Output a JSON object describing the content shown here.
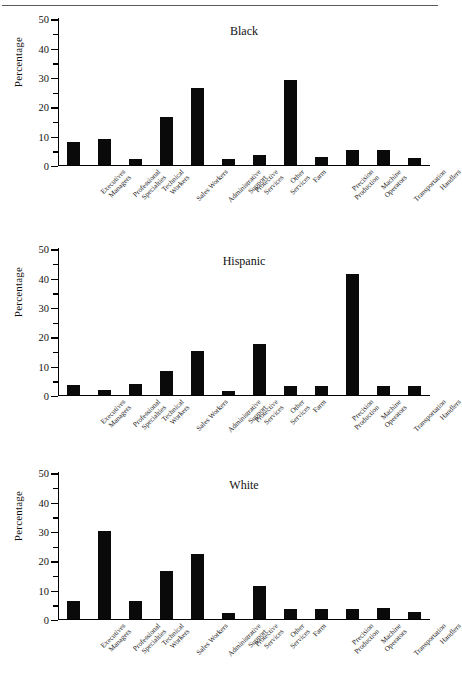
{
  "figure": {
    "y_axis_label": "Percentage",
    "y_ticks": [
      "0",
      "10",
      "20",
      "30",
      "40",
      "50"
    ],
    "categories": [
      "Executives\nManagers",
      "Professional\nSpecialties",
      "Technical\nWorkers",
      "Sales Workers",
      "Administrative\nSupport",
      "Protective\nServices",
      "Other\nServices",
      "Farm",
      "Precision\nProduction",
      "Machine\nOperators",
      "Transportation",
      "Handlers"
    ]
  },
  "chart_data": [
    {
      "type": "bar",
      "title": "Black",
      "xlabel": "",
      "ylabel": "Percentage",
      "ylim": [
        0,
        50
      ],
      "yticks": [
        0,
        10,
        20,
        30,
        40,
        50
      ],
      "minor_tick_step": 5,
      "grid": false,
      "legend": "none",
      "bar_color": "#0a0a0a",
      "categories": [
        "Executives Managers",
        "Professional Specialties",
        "Technical Workers",
        "Sales Workers",
        "Administrative Support",
        "Protective Services",
        "Other Services",
        "Farm",
        "Precision Production",
        "Machine Operators",
        "Transportation",
        "Handlers"
      ],
      "values": [
        7.6,
        8.8,
        1.8,
        16.1,
        26.0,
        1.8,
        3.2,
        28.9,
        2.5,
        5.0,
        5.0,
        2.4
      ]
    },
    {
      "type": "bar",
      "title": "Hispanic",
      "xlabel": "",
      "ylabel": "Percentage",
      "ylim": [
        0,
        50
      ],
      "yticks": [
        0,
        10,
        20,
        30,
        40,
        50
      ],
      "minor_tick_step": 5,
      "grid": false,
      "legend": "none",
      "bar_color": "#0a0a0a",
      "categories": [
        "Executives Managers",
        "Professional Specialties",
        "Technical Workers",
        "Sales Workers",
        "Administrative Support",
        "Protective Services",
        "Other Services",
        "Farm",
        "Precision Production",
        "Machine Operators",
        "Transportation",
        "Handlers"
      ],
      "values": [
        3.2,
        1.7,
        3.7,
        8.2,
        15.0,
        1.4,
        17.4,
        2.8,
        2.9,
        41.3,
        3.1,
        3.0
      ]
    },
    {
      "type": "bar",
      "title": "White",
      "xlabel": "",
      "ylabel": "Percentage",
      "ylim": [
        0,
        50
      ],
      "yticks": [
        0,
        10,
        20,
        30,
        40,
        50
      ],
      "minor_tick_step": 5,
      "grid": false,
      "legend": "none",
      "bar_color": "#0a0a0a",
      "categories": [
        "Executives Managers",
        "Professional Specialties",
        "Technical Workers",
        "Sales Workers",
        "Administrative Support",
        "Protective Services",
        "Other Services",
        "Farm",
        "Precision Production",
        "Machine Operators",
        "Transportation",
        "Handlers"
      ],
      "values": [
        6.0,
        30.0,
        5.9,
        16.2,
        22.0,
        1.9,
        11.2,
        3.4,
        3.4,
        3.3,
        3.6,
        2.2
      ]
    }
  ]
}
